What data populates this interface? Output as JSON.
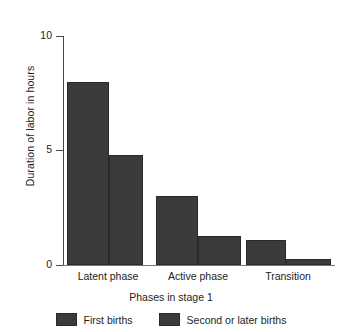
{
  "chart_data": {
    "type": "bar",
    "title": "",
    "subtitle": "",
    "xlabel": "Phases in stage 1",
    "ylabel": "Duration of labor in hours",
    "categories": [
      "Latent phase",
      "Active phase",
      "Transition"
    ],
    "series": [
      {
        "name": "First births",
        "values": [
          8.8,
          3.3,
          1.2
        ],
        "color": "#3b3b3b"
      },
      {
        "name": "Second or later births",
        "values": [
          5.3,
          1.4,
          0.3
        ],
        "color": "#3b3b3b"
      }
    ],
    "ylim": [
      0,
      11
    ],
    "yticks": [
      0,
      5,
      10
    ],
    "ytick_labels": [
      "0",
      "5",
      "10"
    ],
    "grid": false,
    "legend_position": "bottom"
  },
  "axes": {
    "y_title": "Duration of labor in hours",
    "x_title": "Phases in stage 1",
    "y_tick_labels": [
      "10",
      "5",
      "0"
    ],
    "x_tick_labels": [
      "Latent phase",
      "Active phase",
      "Transition"
    ]
  },
  "legend": {
    "items": [
      {
        "label": "First births",
        "color": "#3b3b3b"
      },
      {
        "label": "Second or later births",
        "color": "#3b3b3b"
      }
    ]
  }
}
